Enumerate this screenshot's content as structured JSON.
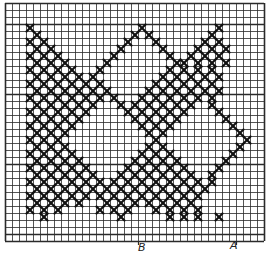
{
  "chart_title": "",
  "grid": {
    "columns": 37,
    "rows": 34,
    "heavy_rows": [
      0,
      3,
      13,
      23,
      33,
      34
    ],
    "heavy_cols": [
      0
    ],
    "line_color": "#2a2a2a",
    "mark_color": "#111111"
  },
  "labels": {
    "b": "B",
    "a": "A"
  },
  "pattern_rows": [
    ".....................................",
    ".....................................",
    ".....................................",
    "...X...............X..........X......",
    "....X.............X.X........X.......",
    "...X.X...........X...X......X.X......",
    "....X.X.........X.....X....X.X.X.....",
    "...X.X.X.......X.......X..X.X.X......",
    "....X.X.X.....X.........XX.X.X.X.....",
    "...X.X.X.X...X.........X.X.X.X.......",
    "....X.X.X.X.X.........X.X.X.X.X......",
    "...X.X.X.X.X.X.......X.X.X.X.X.......",
    "....X.X.X.X.X.X.....X.X.X.X.X.X......",
    "...X.X.X.X.X.X.X...X.X.X.X.X.X.......",
    "....X.X.X.X.X...X.X.X.X.X.X..X.......",
    "...X.X.X.X.X.....X.X.X.X.X....X......",
    "....X.X.X.X.......X.X.X.X......X.....",
    "...X.X.X.X.........X.X.X........X....",
    "....X.X.X...........X.X..........X...",
    "...X.X.X.............X............X..",
    "....X.X.X...........X.X..........X...",
    "...X.X.X.X.........X.X.X........X....",
    "....X.X.X.X.......X.X.X.X......X.....",
    "...X.X.X.X.X.....X.X.X.X.X....X......",
    "....X.X.X.X.X...X.X.X.X.X.X..X.......",
    "...X.X.X.X.X.X.X.X.X.X.X.X.X.X.......",
    "....X.X.X.X.X.X.X.X.X.X.X.X.X........",
    "...X.X.X.X.X.X.X.X.X.X.X.X.X.........",
    "....X.X.X.X...X.X.X.X.X.X.X..........",
    "...X.X.X.....X.X.X...X.X.X.X.........",
    ".....X..........X......X.X.X..X......",
    ".....................................",
    ".....................................",
    "....................................."
  ]
}
